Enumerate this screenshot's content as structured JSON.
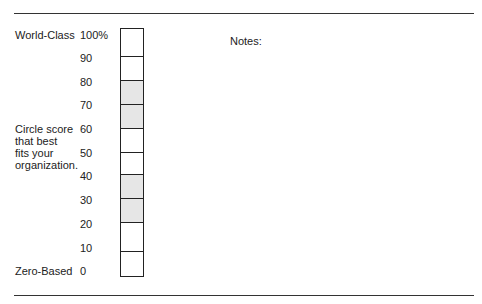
{
  "labels": {
    "top": "World-Class",
    "middle": [
      "Circle score",
      "that best",
      "fits your",
      "organization."
    ],
    "bottom": "Zero-Based"
  },
  "scale": {
    "ticks": [
      "100%",
      "90",
      "80",
      "70",
      "60",
      "50",
      "40",
      "30",
      "20",
      "10",
      "0"
    ],
    "cells": [
      {
        "range": "90-100",
        "shaded": false
      },
      {
        "range": "80-90",
        "shaded": false
      },
      {
        "range": "70-80",
        "shaded": true
      },
      {
        "range": "60-70",
        "shaded": true
      },
      {
        "range": "50-60",
        "shaded": false
      },
      {
        "range": "40-50",
        "shaded": false
      },
      {
        "range": "30-40",
        "shaded": true
      },
      {
        "range": "20-30",
        "shaded": true
      },
      {
        "range": "10-20",
        "shaded": false
      },
      {
        "range": "0-10",
        "shaded": false
      }
    ],
    "shade_color": "#e6e6e6"
  },
  "notes": {
    "label": "Notes:"
  }
}
